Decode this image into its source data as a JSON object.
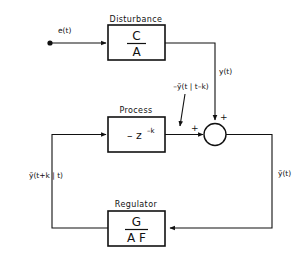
{
  "diagram": {
    "ink_color": "#111111",
    "background": "#ffffff",
    "blocks": [
      {
        "id": "disturbance",
        "title": "Disturbance",
        "numerator": "C",
        "denominator": "A"
      },
      {
        "id": "process",
        "title": "Process",
        "expression_main": "– z",
        "expression_superscript": "–k"
      },
      {
        "id": "regulator",
        "title": "Regulator",
        "numerator": "G",
        "denominator": "A F"
      }
    ],
    "signals": {
      "input": "e(t)",
      "disturbance_output": "y(t)",
      "prediction_negative": "–ỹ(t | t–k)",
      "prediction_ahead": "ỹ(t+k | t)",
      "feedback_output": "ỹ(t)"
    },
    "summing_junction": {
      "sign_top": "+",
      "sign_left": "+"
    }
  }
}
